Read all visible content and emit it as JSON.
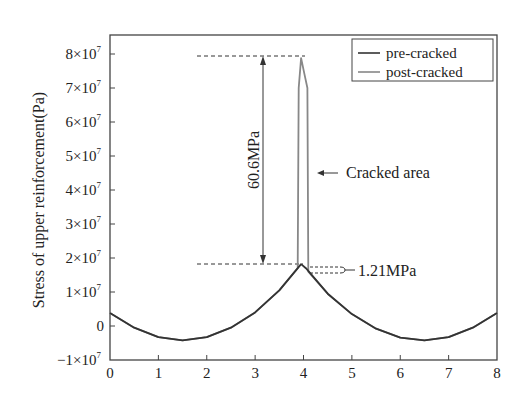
{
  "chart_data": {
    "type": "line",
    "title": "",
    "xlabel": "",
    "ylabel": "Stress of upper reinforcement(Pa)",
    "xlim": [
      0,
      8
    ],
    "ylim": [
      -10000000,
      80000000
    ],
    "x_ticks": [
      "0",
      "1",
      "2",
      "3",
      "4",
      "5",
      "6",
      "7",
      "8"
    ],
    "y_ticks": [
      {
        "value": 80000000,
        "mant": "8",
        "base": "×10",
        "exp": "7"
      },
      {
        "value": 70000000,
        "mant": "7",
        "base": "×10",
        "exp": "7"
      },
      {
        "value": 60000000,
        "mant": "6",
        "base": "×10",
        "exp": "7"
      },
      {
        "value": 50000000,
        "mant": "5",
        "base": "×10",
        "exp": "7"
      },
      {
        "value": 40000000,
        "mant": "4",
        "base": "×10",
        "exp": "7"
      },
      {
        "value": 30000000,
        "mant": "3",
        "base": "×10",
        "exp": "7"
      },
      {
        "value": 20000000,
        "mant": "2",
        "base": "×10",
        "exp": "7"
      },
      {
        "value": 10000000,
        "mant": "1",
        "base": "×10",
        "exp": "7"
      },
      {
        "value": 0,
        "mant": "0",
        "base": "",
        "exp": ""
      },
      {
        "value": -10000000,
        "mant": "−1",
        "base": "×10",
        "exp": "7"
      }
    ],
    "grid": false,
    "legend_position": "upper right",
    "series": [
      {
        "name": "pre-cracked",
        "color": "#333333",
        "x": [
          0,
          0.5,
          1.0,
          1.5,
          2.0,
          2.5,
          3.0,
          3.5,
          3.95,
          4.05,
          4.5,
          5.0,
          5.5,
          6.0,
          6.5,
          7.0,
          7.5,
          8.0
        ],
        "y": [
          3800000,
          -500000,
          -3300000,
          -4200000,
          -3300000,
          -500000,
          4000000,
          10500000,
          18200000,
          17000000,
          9500000,
          3500000,
          -800000,
          -3400000,
          -4200000,
          -3300000,
          -500000,
          3800000
        ]
      },
      {
        "name": "post-cracked",
        "color": "#888888",
        "x": [
          0,
          0.5,
          1.0,
          1.5,
          2.0,
          2.5,
          3.0,
          3.5,
          3.88,
          3.9,
          3.95,
          4.02,
          4.08,
          4.1,
          4.5,
          5.0,
          5.5,
          6.0,
          6.5,
          7.0,
          7.5,
          8.0
        ],
        "y": [
          3800000,
          -500000,
          -3300000,
          -4200000,
          -3300000,
          -500000,
          4000000,
          10500000,
          17000000,
          70000000,
          78800000,
          74000000,
          70000000,
          16000000,
          9500000,
          3500000,
          -800000,
          -3400000,
          -4200000,
          -3300000,
          -500000,
          3800000
        ]
      }
    ],
    "annotations": [
      {
        "text": "60.6MPa",
        "type": "vertical double arrow",
        "from_y": 18200000,
        "to_y": 78800000,
        "x": 2.6
      },
      {
        "text": "Cracked area",
        "type": "arrow pointing left",
        "x": 4.2,
        "y": 43000000
      },
      {
        "text": "1.21MPa",
        "type": "bracket",
        "from_y": 18200000,
        "to_y": 17000000,
        "x": 4.1
      }
    ]
  },
  "labels": {
    "ylabel": "Stress of upper reinforcement(Pa)",
    "legend_pre": "pre-cracked",
    "legend_post": "post-cracked",
    "anno_gap": "60.6MPa",
    "anno_crack": "Cracked area",
    "anno_small": "1.21MPa"
  }
}
